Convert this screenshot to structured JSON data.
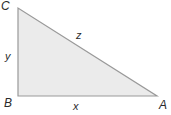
{
  "figure": {
    "type": "right-triangle-diagram",
    "background_color": "#ffffff",
    "fill_color": "#ebebeb",
    "stroke_color": "#999999",
    "label_color": "#2b2b2b",
    "vertices": [
      {
        "name": "C",
        "label": "C",
        "x": 18,
        "y": 8,
        "position": "top-left"
      },
      {
        "name": "B",
        "label": "B",
        "x": 18,
        "y": 96,
        "position": "bottom-left"
      },
      {
        "name": "A",
        "label": "A",
        "x": 157,
        "y": 96,
        "position": "bottom-right"
      }
    ],
    "sides": [
      {
        "name": "vertical-leg",
        "label": "y",
        "from": "B",
        "to": "C"
      },
      {
        "name": "horizontal-leg",
        "label": "x",
        "from": "B",
        "to": "A"
      },
      {
        "name": "hypotenuse",
        "label": "z",
        "from": "A",
        "to": "C"
      }
    ],
    "right_angle_at": "B"
  }
}
